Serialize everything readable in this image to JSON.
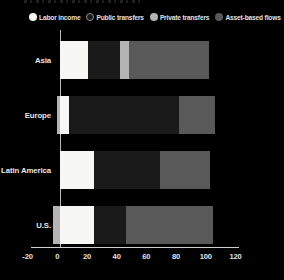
{
  "chart_data": {
    "type": "bar",
    "orientation": "horizontal",
    "stacked": true,
    "title": "",
    "categories": [
      "Asia",
      "Europe",
      "Latin America",
      "U.S."
    ],
    "series": [
      {
        "name": "Labor income",
        "color": "#f7f7f5",
        "values": [
          19,
          6,
          23,
          23
        ]
      },
      {
        "name": "Public transfers",
        "color": "#1a1a1a",
        "ring": "#8f8f8f",
        "values": [
          21,
          74,
          44,
          21
        ]
      },
      {
        "name": "Private transfers",
        "color": "#b4b4b4",
        "values": [
          6,
          -2,
          0,
          -5
        ]
      },
      {
        "name": "Asset-based flows",
        "color": "#595959",
        "values": [
          54,
          24,
          34,
          59
        ]
      }
    ],
    "xlim": [
      -20,
      120
    ],
    "xticks": [
      -20,
      0,
      20,
      40,
      60,
      80,
      100,
      120
    ],
    "legend_position": "top",
    "grid": "zero-line-only",
    "background": "#000000",
    "axis_color": "#cfcfcf",
    "text_color": "#e2e2e2"
  }
}
